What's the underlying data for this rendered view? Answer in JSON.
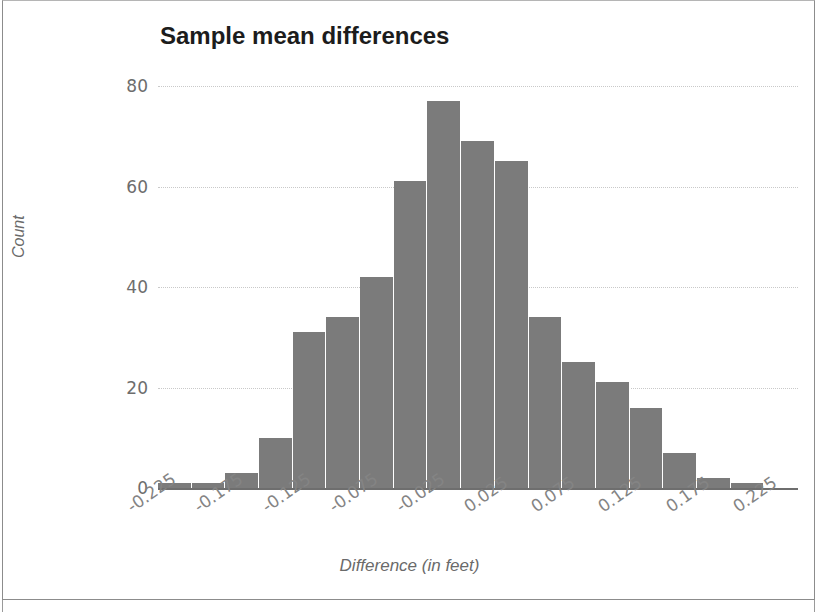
{
  "figure": {
    "title": "Sample mean differences",
    "background_color": "#ffffff",
    "bar_color": "#7b7b7b",
    "gridline_color": "#c9c9c9",
    "axis_color": "#6e6e6e",
    "tick_label_color": "#6d6d6d"
  },
  "axes": {
    "y_title": "Count",
    "x_title": "Difference (in feet)",
    "y_ticks": [
      "0",
      "20",
      "40",
      "60",
      "80"
    ],
    "x_ticks": [
      "-0.225",
      "-0.175",
      "-0.125",
      "-0.075",
      "-0.025",
      "0.025",
      "0.075",
      "0.125",
      "0.175",
      "0.225"
    ]
  },
  "chart_data": {
    "type": "bar",
    "title": "Sample mean differences",
    "xlabel": "Difference (in feet)",
    "ylabel": "Count",
    "grid": true,
    "legend": false,
    "ylim": [
      0,
      80
    ],
    "xlim": [
      -0.2375,
      0.2375
    ],
    "bin_width": 0.025,
    "y_tick_values": [
      0,
      20,
      40,
      60,
      80
    ],
    "x_tick_values": [
      -0.225,
      -0.175,
      -0.125,
      -0.075,
      -0.025,
      0.025,
      0.075,
      0.125,
      0.175,
      0.225
    ],
    "categories": [
      "-0.225",
      "-0.200",
      "-0.175",
      "-0.150",
      "-0.125",
      "-0.100",
      "-0.075",
      "-0.050",
      "-0.025",
      "0.000",
      "0.025",
      "0.050",
      "0.075",
      "0.100",
      "0.125",
      "0.150",
      "0.175",
      "0.200",
      "0.225"
    ],
    "values": [
      1,
      1,
      3,
      10,
      31,
      34,
      42,
      61,
      77,
      69,
      65,
      34,
      25,
      21,
      16,
      7,
      2,
      1,
      0
    ]
  }
}
